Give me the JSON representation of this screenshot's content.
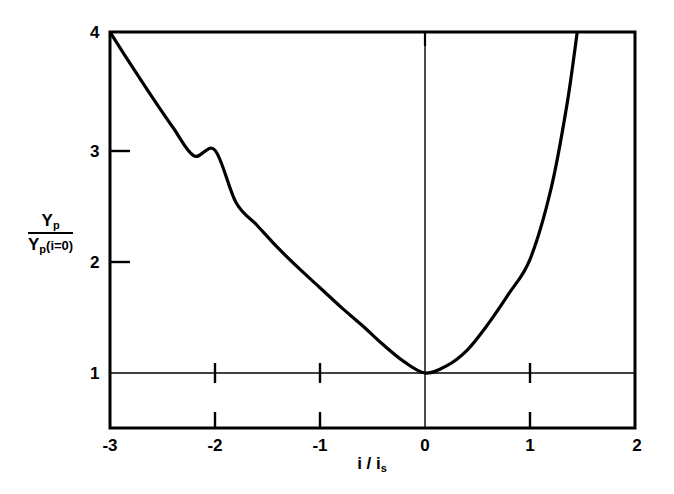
{
  "chart_data": {
    "type": "line",
    "title": "",
    "subtitle": "",
    "xlabel": "i / i_s",
    "xlabel_parts": {
      "main": "i / i",
      "sub": "s"
    },
    "ylabel": "Y_p / Y_p (i=0)",
    "ylabel_parts": {
      "numerator_main": "Y",
      "numerator_sub": "p",
      "denominator_main": "Y",
      "denominator_sub": "p",
      "denominator_paren": "(i=0)"
    },
    "xlim": [
      -3,
      2
    ],
    "ylim": [
      0.5,
      4
    ],
    "xticks": [
      -3,
      -2,
      -1,
      0,
      1,
      2
    ],
    "xtick_labels": [
      "-3",
      "-2",
      "-1",
      "0",
      "1",
      "2"
    ],
    "yticks": [
      1,
      2,
      3,
      4
    ],
    "ytick_labels": [
      "1",
      "2",
      "3",
      "4"
    ],
    "grid": false,
    "legend": null,
    "reference_lines": [
      {
        "axis": "y",
        "value": 1,
        "style": "thin-solid"
      },
      {
        "axis": "x",
        "value": 0,
        "style": "thin-solid"
      }
    ],
    "series": [
      {
        "name": "normalized yield",
        "color": "#000000",
        "linewidth": 3.2,
        "x": [
          -3.0,
          -2.8,
          -2.6,
          -2.4,
          -2.2,
          -2.0,
          -1.8,
          -1.6,
          -1.4,
          -1.2,
          -1.0,
          -0.8,
          -0.6,
          -0.4,
          -0.2,
          0.0,
          0.2,
          0.4,
          0.6,
          0.8,
          1.0,
          1.2,
          1.35,
          1.45
        ],
        "values": [
          4.0,
          3.71,
          3.43,
          3.16,
          2.91,
          2.96,
          2.5,
          2.3,
          2.1,
          1.92,
          1.75,
          1.58,
          1.42,
          1.25,
          1.1,
          1.0,
          1.06,
          1.2,
          1.43,
          1.7,
          2.0,
          2.62,
          3.35,
          4.0
        ]
      }
    ],
    "curve_points": {
      "minimum": {
        "x": 0.0,
        "y": 1.0
      },
      "left_endpoint": {
        "x": -3.0,
        "y": 4.0
      },
      "right_exit": {
        "x": 1.45,
        "y": 4.0
      }
    }
  },
  "axes": {
    "x_tick_labels": [
      {
        "value": -3,
        "label": "-3"
      },
      {
        "value": -2,
        "label": "-2"
      },
      {
        "value": -1,
        "label": "-1"
      },
      {
        "value": 0,
        "label": "0"
      },
      {
        "value": 1,
        "label": "1"
      },
      {
        "value": 2,
        "label": "2"
      }
    ],
    "y_tick_labels": [
      {
        "value": 4,
        "label": "4"
      },
      {
        "value": 3,
        "label": "3"
      },
      {
        "value": 2,
        "label": "2"
      },
      {
        "value": 1,
        "label": "1"
      }
    ],
    "x_title_main": "i / i",
    "x_title_sub": "s",
    "y_title_num_main": "Y",
    "y_title_num_sub": "p",
    "y_title_den_main": "Y",
    "y_title_den_sub": "p",
    "y_title_den_paren": "(i=0)"
  },
  "style": {
    "background": "#ffffff",
    "axis_color": "#000000",
    "curve_color": "#000000"
  }
}
